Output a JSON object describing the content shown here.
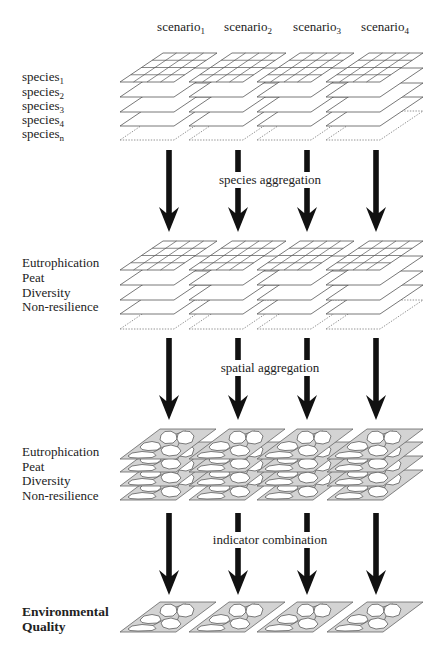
{
  "diagram": {
    "scenarios": [
      {
        "label": "scenario",
        "sub": "1"
      },
      {
        "label": "scenario",
        "sub": "2"
      },
      {
        "label": "scenario",
        "sub": "3"
      },
      {
        "label": "scenario",
        "sub": "4"
      }
    ],
    "stage1": {
      "layer_type": "grid",
      "rows": [
        {
          "label": "species",
          "sub": "1"
        },
        {
          "label": "species",
          "sub": "2"
        },
        {
          "label": "species",
          "sub": "3"
        },
        {
          "label": "species",
          "sub": "4"
        },
        {
          "label": "species",
          "sub": "n"
        }
      ]
    },
    "step1": {
      "label": "species aggregation",
      "arrow_icon": "down-arrow-icon"
    },
    "stage2": {
      "layer_type": "grid",
      "rows": [
        "Eutrophication",
        "Peat",
        "Diversity",
        "Non-resilience"
      ]
    },
    "step2": {
      "label": "spatial aggregation",
      "arrow_icon": "down-arrow-icon"
    },
    "stage3": {
      "layer_type": "map",
      "rows": [
        "Eutrophication",
        "Peat",
        "Diversity",
        "Non-resilience"
      ]
    },
    "step3": {
      "label": "indicator combination",
      "arrow_icon": "down-arrow-icon"
    },
    "result": {
      "line1": "Environmental",
      "line2": "Quality",
      "layer_type": "map"
    }
  },
  "colors": {
    "text": "#222222",
    "layer_stroke": "#555555",
    "map_fill": "#d3d3d3",
    "region_fill": "#ffffff",
    "arrow": "#111111",
    "background": "#ffffff"
  }
}
